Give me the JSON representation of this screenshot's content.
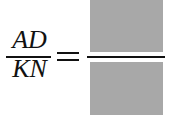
{
  "equation": {
    "left_numerator": "AD",
    "left_denominator": "KN",
    "operator": "=",
    "right_numerator": "",
    "right_denominator": "",
    "box_color": "#a8a8a8"
  }
}
